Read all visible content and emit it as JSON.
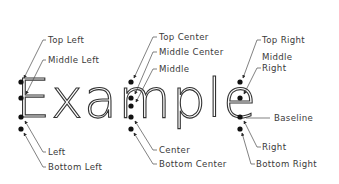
{
  "diagram": {
    "sample_text": "Example",
    "colors": {
      "text": "#3a3a3a",
      "dot": "#111111",
      "leader": "#4a4a4a",
      "background": "#ffffff"
    },
    "groups": {
      "left": {
        "labels": {
          "top": "Top Left",
          "middle": "Middle Left",
          "baseline": "Left",
          "bottom": "Bottom Left"
        }
      },
      "center": {
        "labels": {
          "top": "Top Center",
          "middle_center": "Middle Center",
          "middle": "Middle",
          "baseline": "Center",
          "bottom": "Bottom Center"
        }
      },
      "right": {
        "labels": {
          "top": "Top Right",
          "middle_line1": "Middle",
          "middle_line2": "Right",
          "baseline_label": "Baseline",
          "baseline": "Right",
          "bottom": "Bottom Right"
        }
      }
    }
  }
}
